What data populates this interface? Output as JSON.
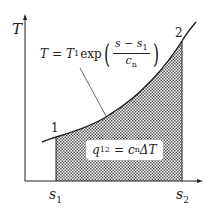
{
  "diagram": {
    "type": "T-s diagram",
    "axes": {
      "y_label": "T",
      "x_ticks": [
        {
          "main": "s",
          "sub": "1"
        },
        {
          "main": "s",
          "sub": "2"
        }
      ]
    },
    "points": [
      {
        "label": "1"
      },
      {
        "label": "2"
      }
    ],
    "curve_equation": {
      "lhs": "T",
      "eq": "=",
      "coef_main": "T",
      "coef_sub": "1",
      "func": "exp",
      "num_main": "s − s",
      "num_sub": "1",
      "den_main": "c",
      "den_sub": "n"
    },
    "area_label": {
      "lhs_main": "q",
      "lhs_sub": "12",
      "eq": "=",
      "rhs_main": "c",
      "rhs_sub": "n",
      "rhs_tail": "ΔT"
    },
    "colors": {
      "line": "#222222",
      "hatch": "#555555",
      "background": "#ffffff"
    }
  }
}
